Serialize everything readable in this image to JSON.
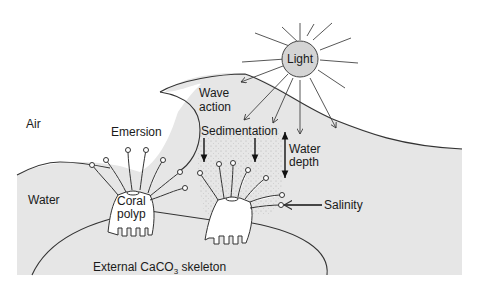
{
  "diagram": {
    "type": "environmental factors affecting coral",
    "labels": {
      "light": "Light",
      "wave_action_1": "Wave",
      "wave_action_2": "action",
      "air": "Air",
      "emersion": "Emersion",
      "sedimentation": "Sedimentation",
      "water_depth_1": "Water",
      "water_depth_2": "depth",
      "water": "Water",
      "coral_polyp_1": "Coral",
      "coral_polyp_2": "polyp",
      "salinity": "Salinity",
      "skeleton_prefix": "External CaCO",
      "skeleton_sub": "3",
      "skeleton_suffix": " skeleton"
    },
    "colors": {
      "water_fill": "#e6e6e6",
      "sun_fill": "#d4d4d4",
      "line": "#222222",
      "background": "#ffffff"
    }
  }
}
